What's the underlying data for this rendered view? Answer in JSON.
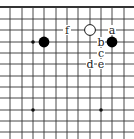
{
  "diagram": {
    "type": "go-board-fragment",
    "grid": {
      "x_lines": [
        10,
        22,
        33,
        44,
        56,
        67,
        78,
        90,
        101,
        112,
        124
      ],
      "y_lines": [
        7,
        19,
        30,
        42,
        53,
        64,
        76,
        87,
        98,
        110,
        121,
        132
      ],
      "top_edge_y": 7,
      "line_color": "#333333"
    },
    "star_points": [
      {
        "x": 33,
        "y": 42
      },
      {
        "x": 33,
        "y": 110
      },
      {
        "x": 101,
        "y": 110
      }
    ],
    "stones": [
      {
        "color": "black",
        "x": 44,
        "y": 42
      },
      {
        "color": "white",
        "x": 90,
        "y": 30
      },
      {
        "color": "black",
        "x": 112,
        "y": 42
      }
    ],
    "labels": [
      {
        "text": "f",
        "x": 67,
        "y": 30
      },
      {
        "text": "a",
        "x": 112,
        "y": 30
      },
      {
        "text": "b",
        "x": 101,
        "y": 42
      },
      {
        "text": "c",
        "x": 101,
        "y": 53
      },
      {
        "text": "d",
        "x": 90,
        "y": 64
      },
      {
        "text": "e",
        "x": 101,
        "y": 64
      }
    ]
  }
}
